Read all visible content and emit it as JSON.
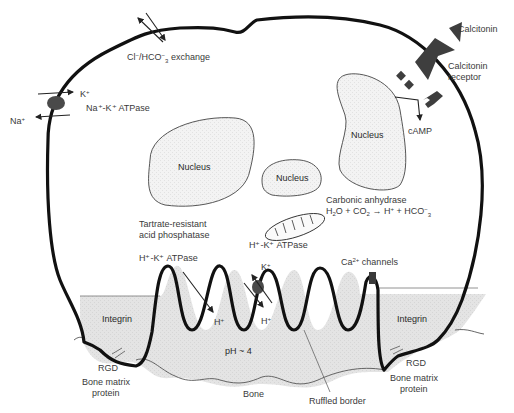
{
  "colors": {
    "membrane": "#111111",
    "bone_fill": "#e2e2e2",
    "nucleus_fill": "#f1f1f1",
    "receptor": "#3e3e3e",
    "pump": "#444444",
    "text": "#3a3a3a"
  },
  "labels": {
    "cl_hco3_exchange": {
      "pre": "Cl",
      "sup1": "−",
      "mid": "/HCO",
      "sup2": "−",
      "sub": "3",
      "post": " exchange"
    },
    "k_plus_left": {
      "base": "K",
      "sup": "+"
    },
    "na_plus": {
      "base": "Na",
      "sup": "+"
    },
    "na_k_atpase": "Na⁺-K⁺ ATPase",
    "calcitonin": "Calcitonin",
    "calcitonin_receptor_line1": "Calcitonin",
    "calcitonin_receptor_line2": "receptor",
    "camp": "cAMP",
    "nucleus_1": "Nucleus",
    "nucleus_2": "Nucleus",
    "nucleus_3": "Nucleus",
    "carbonic_anhydrase": "Carbonic anhydrase",
    "reaction": {
      "h2o": "H",
      "h2o_sub": "2",
      "h2o_o": "O + CO",
      "co2_sub": "2",
      "arrow": " → H",
      "hplus_sup": "+",
      "hco": " + HCO",
      "hco_sup": "−",
      "hco_sub": "3"
    },
    "trap_line1": "Tartrate-resistant",
    "trap_line2": "acid phosphatase",
    "h_k_atpase_left": "H⁺-K⁺ ATPase",
    "h_k_atpase_mito": "H⁺-K⁺ ATPase",
    "ca_channels": {
      "base": "Ca",
      "sup": "2+",
      "post": " channels"
    },
    "k_plus_pump": {
      "base": "K",
      "sup": "+"
    },
    "h_plus_1": {
      "base": "H",
      "sup": "+"
    },
    "h_plus_2": {
      "base": "H",
      "sup": "+"
    },
    "integrin_left": "Integrin",
    "integrin_right": "Integrin",
    "ph": "pH ~ 4",
    "rgd_left": "RGD",
    "rgd_right": "RGD",
    "bone_matrix_left_1": "Bone matrix",
    "bone_matrix_left_2": "protein",
    "bone_matrix_right_1": "Bone matrix",
    "bone_matrix_right_2": "protein",
    "bone": "Bone",
    "ruffled_border": "Ruffled border"
  }
}
